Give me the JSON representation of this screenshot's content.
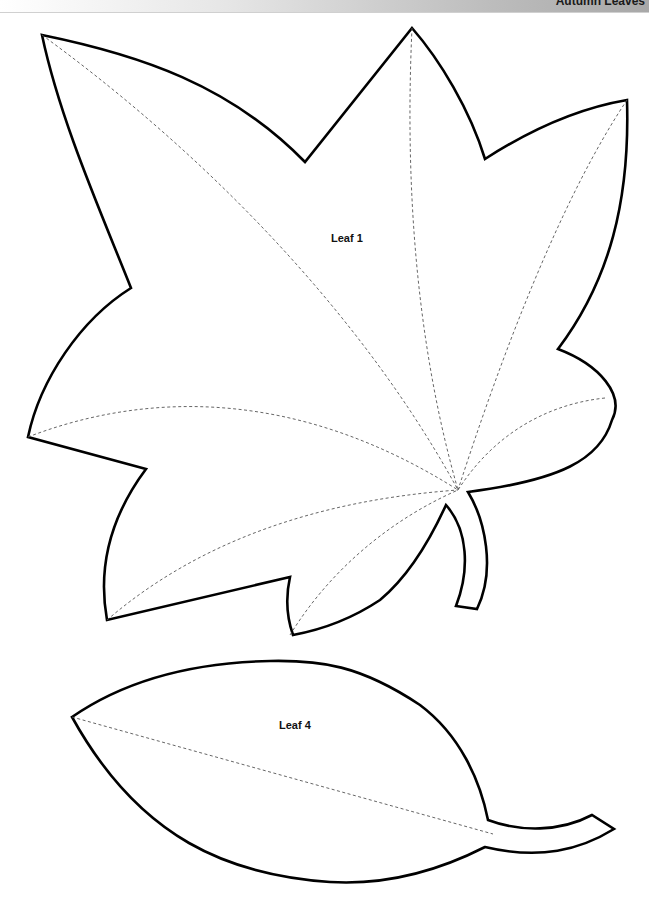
{
  "header": {
    "title": "Autumn Leaves",
    "gradient_colors": [
      "#ffffff",
      "#a8a8a8"
    ]
  },
  "leaves": [
    {
      "id": "leaf-1",
      "label": "Leaf 1",
      "outline_style": "solid black",
      "vein_style": "dashed gray"
    },
    {
      "id": "leaf-4",
      "label": "Leaf 4",
      "outline_style": "solid black",
      "vein_style": "dashed gray"
    }
  ],
  "colors": {
    "outline": "#000000",
    "vein": "#555555",
    "background": "#ffffff"
  }
}
